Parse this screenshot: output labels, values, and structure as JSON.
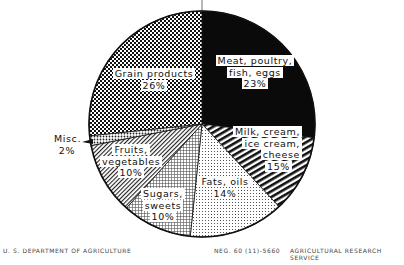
{
  "chart_data": {
    "type": "pie",
    "title": "",
    "start_angle_deg": 0,
    "direction": "clockwise",
    "categories": [
      "Meat, poultry, fish, eggs",
      "Milk, cream, ice cream, cheese",
      "Fats, oils",
      "Sugars, sweets",
      "Fruits, vegetables",
      "Misc.",
      "Grain products"
    ],
    "values": [
      23,
      15,
      14,
      10,
      10,
      2,
      26
    ],
    "unit": "%",
    "slices": [
      {
        "name": "Meat, poultry, fish, eggs",
        "value": 23,
        "pattern": "solid-black"
      },
      {
        "name": "Milk, cream, ice cream, cheese",
        "value": 15,
        "pattern": "diagonal-stripes-heavy"
      },
      {
        "name": "Fats, oils",
        "value": 14,
        "pattern": "fine-dots"
      },
      {
        "name": "Sugars, sweets",
        "value": 10,
        "pattern": "cross-hatch-light"
      },
      {
        "name": "Fruits, vegetables",
        "value": 10,
        "pattern": "diagonal-stripes-light"
      },
      {
        "name": "Misc.",
        "value": 2,
        "pattern": "dots-medium"
      },
      {
        "name": "Grain products",
        "value": 26,
        "pattern": "checkerboard-dark"
      }
    ],
    "legend": "none (labels inside slices)"
  },
  "labels": {
    "meat": {
      "line1": "Meat, poultry,",
      "line2": "fish, eggs",
      "pct": "23%"
    },
    "milk": {
      "line1": "Milk, cream,",
      "line2": "ice cream,",
      "line3": "cheese",
      "pct": "15%"
    },
    "fats": {
      "line1": "Fats, oils",
      "pct": "14%"
    },
    "sugars": {
      "line1": "Sugars,",
      "line2": "sweets",
      "pct": "10%"
    },
    "fruits": {
      "line1": "Fruits,",
      "line2": "vegetables",
      "pct": "10%"
    },
    "misc": {
      "line1": "Misc.",
      "pct": "2%"
    },
    "grain": {
      "line1": "Grain products",
      "pct": "26%"
    }
  },
  "footer": {
    "left": "U. S. DEPARTMENT OF AGRICULTURE",
    "neg": "NEG. 60 (11)-5660",
    "right": "AGRICULTURAL RESEARCH SERVICE"
  }
}
